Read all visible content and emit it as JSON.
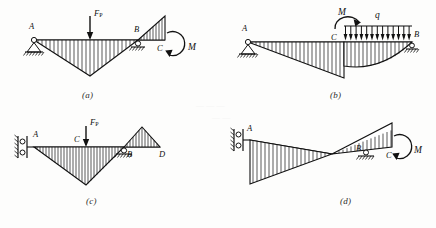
{
  "figure": {
    "background_color": "#fdfdfc",
    "ink_color": "#111111",
    "panel_count": 4
  },
  "panels": [
    {
      "caption": "(a)",
      "points": [
        "A",
        "B",
        "C"
      ],
      "loads": [
        {
          "symbol": "F",
          "subscript": "P",
          "type": "point-load",
          "direction": "down"
        },
        {
          "symbol": "M",
          "type": "couple",
          "direction": "clockwise"
        }
      ],
      "supports": [
        {
          "at": "A",
          "type": "pin"
        },
        {
          "at": "B",
          "type": "roller"
        }
      ],
      "diagram_regions": [
        {
          "name": "negative-sagging-triangle",
          "sign": "negative",
          "shape": "triangle"
        },
        {
          "name": "positive-overhang-triangle",
          "sign": "positive",
          "shape": "triangle"
        }
      ]
    },
    {
      "caption": "(b)",
      "points": [
        "A",
        "B",
        "C"
      ],
      "loads": [
        {
          "symbol": "M",
          "type": "couple",
          "direction": "clockwise"
        },
        {
          "symbol": "q",
          "type": "distributed-load",
          "direction": "down",
          "arrow_count": 13
        }
      ],
      "supports": [
        {
          "at": "A",
          "type": "pin"
        },
        {
          "at": "B",
          "type": "roller"
        }
      ],
      "diagram_regions": [
        {
          "name": "left-linear-wedge",
          "sign": "negative",
          "shape": "triangle"
        },
        {
          "name": "right-parabolic-area",
          "sign": "negative",
          "shape": "parabola"
        }
      ]
    },
    {
      "caption": "(c)",
      "points": [
        "A",
        "B",
        "C",
        "D"
      ],
      "loads": [
        {
          "symbol": "F",
          "subscript": "P",
          "type": "point-load",
          "direction": "down"
        }
      ],
      "supports": [
        {
          "at": "A",
          "type": "guided-sliding"
        },
        {
          "at": "B",
          "type": "roller"
        }
      ],
      "diagram_regions": [
        {
          "name": "negative-sagging-triangle",
          "sign": "negative",
          "shape": "triangle"
        },
        {
          "name": "positive-triangle",
          "sign": "positive",
          "shape": "triangle"
        }
      ]
    },
    {
      "caption": "(d)",
      "points": [
        "A",
        "B",
        "C"
      ],
      "loads": [
        {
          "symbol": "M",
          "type": "couple",
          "direction": "clockwise"
        }
      ],
      "supports": [
        {
          "at": "A",
          "type": "guided-sliding"
        },
        {
          "at": "B",
          "type": "roller"
        }
      ],
      "diagram_regions": [
        {
          "name": "left-negative-wedge",
          "sign": "negative",
          "shape": "triangle"
        },
        {
          "name": "right-positive-wedge",
          "sign": "positive",
          "shape": "triangle"
        }
      ]
    }
  ],
  "labels": {
    "A": "A",
    "B": "B",
    "C": "C",
    "D": "D",
    "M": "M",
    "q": "q",
    "F": "F",
    "F_sub": "P",
    "cap_a": "(a)",
    "cap_b": "(b)",
    "cap_c": "(c)",
    "cap_d": "(d)"
  }
}
